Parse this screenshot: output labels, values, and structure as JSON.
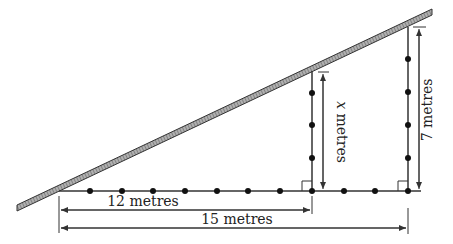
{
  "diagram": {
    "roof": {
      "x1": 17,
      "y1": 208,
      "x2": 432,
      "y2": 12,
      "thickness": 6,
      "stroke": "#333333",
      "fill": "#9a9a9a"
    },
    "ground": {
      "x1": 59,
      "x2": 421,
      "y": 191
    },
    "ground_dots_x": [
      90,
      122,
      153,
      185,
      217,
      248,
      280,
      312,
      344,
      375,
      408
    ],
    "posts": [
      {
        "name": "post-x",
        "x": 312,
        "top": 71,
        "bottom": 191,
        "dots_y": [
          93,
          125,
          158,
          191
        ]
      },
      {
        "name": "post-7",
        "x": 408,
        "top": 27,
        "bottom": 191,
        "dots_y": [
          59,
          92,
          125,
          158,
          191
        ]
      }
    ],
    "labels": {
      "short_base": "12 metres",
      "long_base": "15 metres",
      "short_post": "metres",
      "short_post_var": "x",
      "tall_post": "7 metres"
    },
    "colors": {
      "line": "#333333",
      "dot": "#111111",
      "text": "#222222"
    }
  }
}
